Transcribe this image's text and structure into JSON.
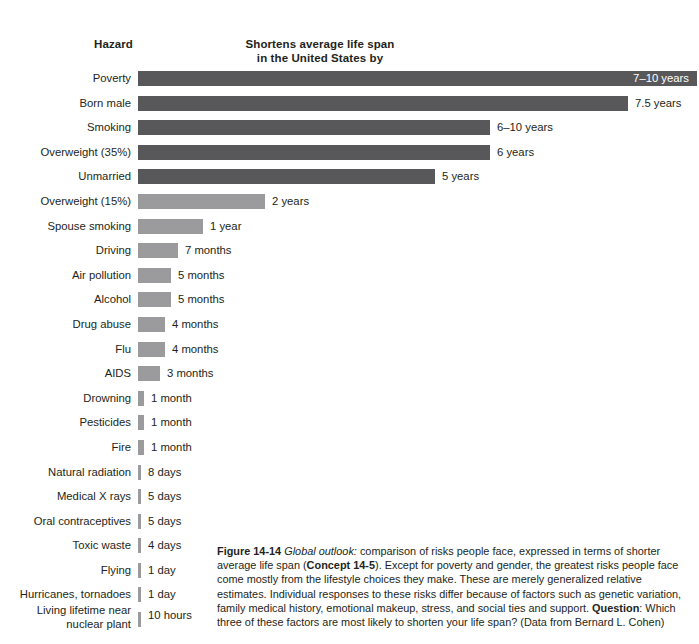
{
  "header": {
    "hazard_label": "Hazard",
    "value_title_line1": "Shortens average life span",
    "value_title_line2": "in the United States by"
  },
  "chart_data": {
    "type": "bar",
    "orientation": "horizontal",
    "title": "Shortens average life span in the United States by",
    "xlabel": "",
    "ylabel": "Hazard",
    "grid": false,
    "legend": "none",
    "categories": [
      "Poverty",
      "Born male",
      "Smoking",
      "Overweight (35%)",
      "Unmarried",
      "Overweight (15%)",
      "Spouse smoking",
      "Driving",
      "Air pollution",
      "Alcohol",
      "Drug abuse",
      "Flu",
      "AIDS",
      "Drowning",
      "Pesticides",
      "Fire",
      "Natural radiation",
      "Medical X rays",
      "Oral contraceptives",
      "Toxic waste",
      "Flying",
      "Hurricanes, tornadoes",
      "Living lifetime near nuclear plant"
    ],
    "value_labels": [
      "7–10 years",
      "7.5 years",
      "6–10 years",
      "6 years",
      "5 years",
      "2 years",
      "1 year",
      "7 months",
      "5 months",
      "5 months",
      "4 months",
      "4 months",
      "3 months",
      "1 month",
      "1 month",
      "1 month",
      "8 days",
      "5 days",
      "5 days",
      "4 days",
      "1 day",
      "1 day",
      "10 hours"
    ],
    "values_days": [
      3105,
      2738,
      2920,
      2190,
      1825,
      730,
      365,
      213,
      152,
      152,
      122,
      122,
      91,
      30,
      30,
      30,
      8,
      5,
      5,
      4,
      1,
      1,
      0.42
    ],
    "colors": {
      "dark": "#58585a",
      "light": "#9b9b9d"
    }
  },
  "rows": [
    {
      "label": "Poverty",
      "value": "7–10 years",
      "bar_width": 559,
      "tone": "dark",
      "label_inside": true,
      "two_line": false
    },
    {
      "label": "Born male",
      "value": "7.5 years",
      "bar_width": 490,
      "tone": "dark",
      "label_inside": false,
      "two_line": false
    },
    {
      "label": "Smoking",
      "value": "6–10 years",
      "bar_width": 352,
      "tone": "dark",
      "label_inside": false,
      "two_line": false
    },
    {
      "label": "Overweight (35%)",
      "value": "6 years",
      "bar_width": 352,
      "tone": "dark",
      "label_inside": false,
      "two_line": false
    },
    {
      "label": "Unmarried",
      "value": "5 years",
      "bar_width": 297,
      "tone": "dark",
      "label_inside": false,
      "two_line": false
    },
    {
      "label": "Overweight (15%)",
      "value": "2 years",
      "bar_width": 127,
      "tone": "light",
      "label_inside": false,
      "two_line": false
    },
    {
      "label": "Spouse smoking",
      "value": "1 year",
      "bar_width": 65,
      "tone": "light",
      "label_inside": false,
      "two_line": false
    },
    {
      "label": "Driving",
      "value": "7 months",
      "bar_width": 40,
      "tone": "light",
      "label_inside": false,
      "two_line": false
    },
    {
      "label": "Air pollution",
      "value": "5 months",
      "bar_width": 33,
      "tone": "light",
      "label_inside": false,
      "two_line": false
    },
    {
      "label": "Alcohol",
      "value": "5 months",
      "bar_width": 33,
      "tone": "light",
      "label_inside": false,
      "two_line": false
    },
    {
      "label": "Drug abuse",
      "value": "4 months",
      "bar_width": 27,
      "tone": "light",
      "label_inside": false,
      "two_line": false
    },
    {
      "label": "Flu",
      "value": "4 months",
      "bar_width": 27,
      "tone": "light",
      "label_inside": false,
      "two_line": false
    },
    {
      "label": "AIDS",
      "value": "3 months",
      "bar_width": 22,
      "tone": "light",
      "label_inside": false,
      "two_line": false
    },
    {
      "label": "Drowning",
      "value": "1 month",
      "bar_width": 6,
      "tone": "light",
      "label_inside": false,
      "two_line": false
    },
    {
      "label": "Pesticides",
      "value": "1 month",
      "bar_width": 6,
      "tone": "light",
      "label_inside": false,
      "two_line": false
    },
    {
      "label": "Fire",
      "value": "1 month",
      "bar_width": 6,
      "tone": "light",
      "label_inside": false,
      "two_line": false
    },
    {
      "label": "Natural radiation",
      "value": "8 days",
      "bar_width": 3,
      "tone": "light",
      "label_inside": false,
      "two_line": false
    },
    {
      "label": "Medical X rays",
      "value": "5 days",
      "bar_width": 3,
      "tone": "light",
      "label_inside": false,
      "two_line": false
    },
    {
      "label": "Oral contraceptives",
      "value": "5 days",
      "bar_width": 3,
      "tone": "light",
      "label_inside": false,
      "two_line": false
    },
    {
      "label": "Toxic waste",
      "value": "4 days",
      "bar_width": 3,
      "tone": "light",
      "label_inside": false,
      "two_line": false
    },
    {
      "label": "Flying",
      "value": "1 day",
      "bar_width": 3,
      "tone": "light",
      "label_inside": false,
      "two_line": false
    },
    {
      "label": "Hurricanes, tornadoes",
      "value": "1 day",
      "bar_width": 3,
      "tone": "light",
      "label_inside": false,
      "two_line": false
    },
    {
      "label": "Living lifetime near\nnuclear plant",
      "value": "10 hours",
      "bar_width": 3,
      "tone": "light",
      "label_inside": false,
      "two_line": true
    }
  ],
  "caption": {
    "figure_number": "Figure 14-14",
    "emphasis": "Global outlook:",
    "text_1": " comparison of risks people face, expressed in terms of shorter average life span (",
    "concept": "Concept 14-5",
    "text_2": "). Except for poverty and gender, the greatest risks people face come mostly from the lifestyle choices they make. These are merely generalized relative estimates. Individual responses to these risks differ because of factors such as genetic variation, family medical history, emotional makeup, stress, and social ties and support. ",
    "question_label": "Question",
    "text_3": ": Which three of these factors are most likely to shorten your life span? (Data from Bernard L. Cohen)"
  }
}
